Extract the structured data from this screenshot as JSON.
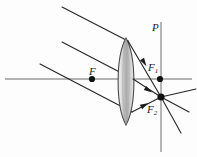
{
  "figure": {
    "background_color": "#fdfdfd",
    "width": 197,
    "height": 157
  },
  "labels": {
    "plane": {
      "text": "P",
      "x": 152,
      "y": 22
    },
    "focal_point": {
      "text": "F",
      "x": 89,
      "y": 66
    },
    "focal_point_1": {
      "base": "F",
      "sub": "1",
      "x": 148,
      "y": 62
    },
    "focal_point_2": {
      "base": "F",
      "sub": "2",
      "x": 147,
      "y": 104
    }
  },
  "colors": {
    "axis": "#9a9a9a",
    "ray": "#262626",
    "lens_outline": "#4a4a4a",
    "lens_fill_light": "#efefef",
    "lens_fill_mid": "#c8c8c8",
    "lens_fill_dark": "#a8a8a8",
    "point_marker": "#111111",
    "focal_plane_line": "#8f8f8f"
  },
  "geometry": {
    "optical_axis": {
      "x1": 5,
      "y1": 79,
      "x2": 192,
      "y2": 79
    },
    "focal_plane": {
      "x1": 161,
      "y1": 22,
      "x2": 161,
      "y2": 152,
      "label": "P"
    },
    "lens": {
      "center_x": 126,
      "top_y": 38,
      "bottom_y": 125,
      "half_width": 8.5,
      "type": "biconvex"
    },
    "incident_rays": [
      {
        "x1": 62,
        "y1": 7,
        "x2": 128,
        "y2": 41
      },
      {
        "x1": 62,
        "y1": 42,
        "x2": 133,
        "y2": 79
      },
      {
        "x1": 40,
        "y1": 64,
        "x2": 132,
        "y2": 112
      }
    ],
    "refracted_rays": [
      {
        "x1": 128,
        "y1": 41,
        "x2": 161,
        "y2": 97
      },
      {
        "x1": 133,
        "y1": 79,
        "x2": 161,
        "y2": 97
      },
      {
        "x1": 132,
        "y1": 112,
        "x2": 161,
        "y2": 97
      }
    ],
    "exit_rays": [
      {
        "x1": 161,
        "y1": 97,
        "x2": 196,
        "y2": 89
      },
      {
        "x1": 161,
        "y1": 97,
        "x2": 189,
        "y2": 112
      },
      {
        "x1": 161,
        "y1": 97,
        "x2": 181,
        "y2": 133
      }
    ],
    "points": [
      {
        "name": "F",
        "x": 92,
        "y": 79
      },
      {
        "name": "F1",
        "x": 160,
        "y": 79
      },
      {
        "name": "F2",
        "x": 161,
        "y": 97
      }
    ],
    "arrow_markers": [
      {
        "x": 142,
        "y": 59,
        "angle": 59
      },
      {
        "x": 144,
        "y": 87,
        "angle": 32
      },
      {
        "x": 142,
        "y": 106,
        "angle": -27
      }
    ]
  }
}
